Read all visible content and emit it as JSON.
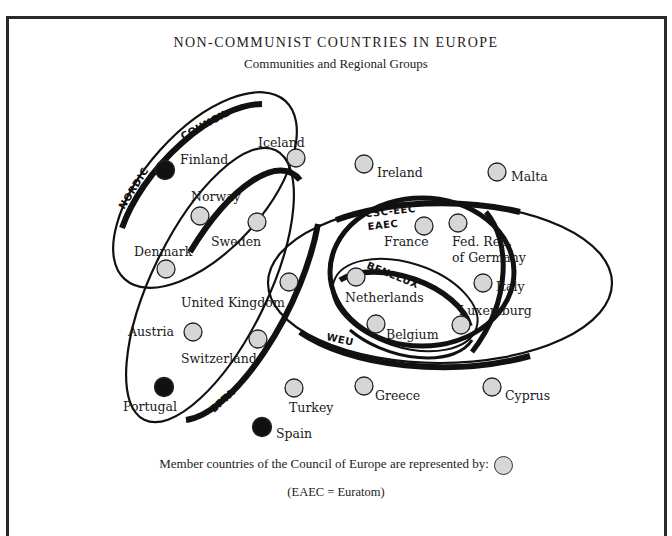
{
  "header": {
    "title": "NON-COMMUNIST COUNTRIES IN EUROPE",
    "subtitle": "Communities and Regional Groups"
  },
  "groups": {
    "nordic": "NORDIC",
    "council": "COUNCIL",
    "efta": "EFTA",
    "weu": "WEU",
    "ecsc": "ECSC-EEC",
    "eaec": "EAEC",
    "benelux": "BENELUX"
  },
  "countries": {
    "iceland": "Iceland",
    "finland": "Finland",
    "norway": "Norway",
    "sweden": "Sweden",
    "denmark": "Denmark",
    "united_kingdom": "United Kingdom",
    "austria": "Austria",
    "switzerland": "Switzerland",
    "portugal": "Portugal",
    "turkey": "Turkey",
    "spain": "Spain",
    "ireland": "Ireland",
    "malta": "Malta",
    "france": "France",
    "germany_1": "Fed. Rep.",
    "germany_2": "of Germany",
    "netherlands": "Netherlands",
    "italy": "Italy",
    "luxemburg": "Luxemburg",
    "belgium": "Belgium",
    "greece": "Greece",
    "cyprus": "Cyprus"
  },
  "legend": {
    "text": "Member countries of the Council of Europe are represented by:",
    "note": "(EAEC = Euratom)"
  },
  "colors": {
    "member_fill": "#d6d6d6",
    "non_member_fill": "#111111",
    "outline": "#1a1a1a"
  }
}
